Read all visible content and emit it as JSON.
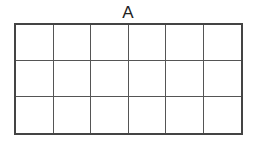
{
  "diagram": {
    "label": "A",
    "grid": {
      "rows": 3,
      "cols": 6
    },
    "colors": {
      "border": "#444444",
      "lines": "#555555",
      "background": "#ffffff"
    }
  }
}
